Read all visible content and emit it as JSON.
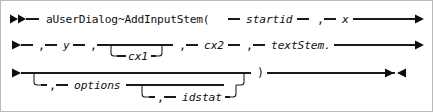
{
  "diagram": {
    "kind": "railroad-syntax-diagram",
    "colors": {
      "background": "#ffffff",
      "border": "#b9b9b9",
      "rail": "#1a1a1a",
      "text": "#111111"
    },
    "start_marker": "►►",
    "continue_marker": "►",
    "end_marker": "►◄",
    "rows": [
      {
        "id": "row-1",
        "tokens": [
          {
            "name": "keyword-ausedialog-addinputstem",
            "text": "aUserDialog~AddInputStem(",
            "style": "literal"
          },
          {
            "name": "param-startid",
            "text": "startid",
            "style": "variable"
          },
          {
            "name": "comma-1",
            "text": ",",
            "style": "punct"
          },
          {
            "name": "param-x",
            "text": "x",
            "style": "variable"
          }
        ]
      },
      {
        "id": "row-2",
        "tokens": [
          {
            "name": "comma-2",
            "text": ",",
            "style": "punct"
          },
          {
            "name": "param-y",
            "text": "y",
            "style": "variable"
          },
          {
            "name": "comma-3",
            "text": ",",
            "style": "punct"
          },
          {
            "name": "optional-param-cx1",
            "text": "cx1",
            "style": "variable"
          },
          {
            "name": "comma-4",
            "text": ",",
            "style": "punct"
          },
          {
            "name": "param-cx2",
            "text": "cx2",
            "style": "variable"
          },
          {
            "name": "comma-5",
            "text": ",",
            "style": "punct"
          },
          {
            "name": "param-textstem",
            "text": "textStem.",
            "style": "variable"
          }
        ]
      },
      {
        "id": "row-3",
        "tokens": [
          {
            "name": "comma-6",
            "text": ",",
            "style": "punct"
          },
          {
            "name": "optional-param-options",
            "text": "options",
            "style": "variable"
          },
          {
            "name": "comma-7",
            "text": ",",
            "style": "punct"
          },
          {
            "name": "optional-param-idstat",
            "text": "idstat",
            "style": "variable"
          },
          {
            "name": "close-paren",
            "text": ")",
            "style": "punct"
          }
        ]
      }
    ],
    "labels": {
      "keyword": "aUserDialog~AddInputStem(",
      "startid": "startid",
      "x": "x",
      "y": "y",
      "cx1": "cx1",
      "cx2": "cx2",
      "textStem": "textStem.",
      "options": "options",
      "idstat": "idstat",
      "comma": ",",
      "dash": "—",
      "close_paren": ")"
    }
  }
}
